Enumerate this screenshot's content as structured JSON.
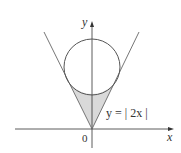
{
  "diagram": {
    "axes": {
      "x_label": "x",
      "y_label": "y",
      "origin_label": "0"
    },
    "curve_label": "y = | 2x |",
    "elements": [
      {
        "type": "circle",
        "description": "circle tangent to both branches of y=|2x|"
      },
      {
        "type": "v-curve",
        "equation": "y = |2x|"
      },
      {
        "type": "shaded-region",
        "description": "region between y=|2x| and the lower arc of the circle"
      }
    ],
    "colors": {
      "stroke": "#555555",
      "fill": "#d9d9d9",
      "axis": "#333333"
    }
  }
}
